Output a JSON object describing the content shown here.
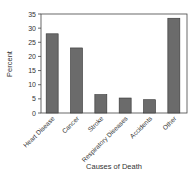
{
  "chart_data": {
    "type": "bar",
    "title": "",
    "xlabel": "Causes of Death",
    "ylabel": "Percent",
    "categories": [
      "Heart Disease",
      "Cancer",
      "Stroke",
      "Respiratory Diseases",
      "Accidents",
      "Other"
    ],
    "values": [
      28,
      23,
      6.5,
      5.3,
      4.7,
      33.5
    ],
    "ylim": [
      0,
      35
    ],
    "yticks": [
      0,
      5,
      10,
      15,
      20,
      25,
      30,
      35
    ],
    "grid": false,
    "legend": null,
    "bar_color": "#6b6b6b",
    "bar_edge_color": "#333333"
  }
}
